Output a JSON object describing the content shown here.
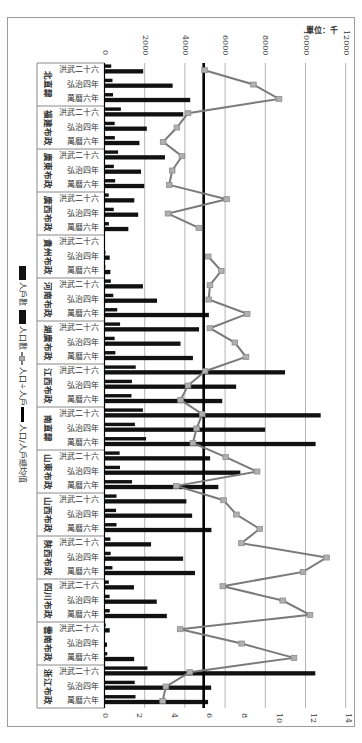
{
  "chart_data": {
    "type": "bar",
    "orientation": "rotated 90° clockwise (horizontal bars, categories top-to-bottom)",
    "unit_label": "單位：千",
    "primary_axis": {
      "ticks": [
        0,
        2000,
        4000,
        6000,
        8000,
        10000,
        12000
      ],
      "range": [
        0,
        12000
      ],
      "label": ""
    },
    "secondary_axis": {
      "ticks": [
        0,
        2,
        4,
        6,
        8,
        10,
        12,
        14
      ],
      "range": [
        0,
        14
      ],
      "label": ""
    },
    "grid": true,
    "legend_position": "left (rotated)",
    "legend": [
      {
        "label": "人戶數",
        "kind": "bar"
      },
      {
        "label": "人口數",
        "kind": "bar"
      },
      {
        "label": "人口÷人戶",
        "kind": "line-marker"
      },
      {
        "label": "人口/人戶總均值",
        "kind": "line"
      }
    ],
    "periods": [
      "洪武二十六",
      "弘治四年",
      "萬曆六年"
    ],
    "mean_ratio": 5.7,
    "colors": {
      "bars": "#111111",
      "ratio_line": "#7a7a7a",
      "ratio_marker": "#b0b0b0",
      "mean_line": "#000000",
      "grid": "#b5b5b5"
    },
    "groups": [
      {
        "province": "北直隸",
        "rows": [
          {
            "period": "洪武二十六",
            "households": 334.8,
            "population": 1926.6,
            "ratio": 5.75
          },
          {
            "period": "弘治四年",
            "households": 396.0,
            "population": 3390.0,
            "ratio": 8.56
          },
          {
            "period": "萬曆六年",
            "households": 425.5,
            "population": 4265.7,
            "ratio": 10.03
          }
        ]
      },
      {
        "province": "福建布政",
        "rows": [
          {
            "period": "洪武二十六",
            "households": 815.5,
            "population": 3916.8,
            "ratio": 4.8
          },
          {
            "period": "弘治四年",
            "households": 506.0,
            "population": 2106.1,
            "ratio": 4.16
          },
          {
            "period": "萬曆六年",
            "households": 515.3,
            "population": 1738.8,
            "ratio": 3.37
          }
        ]
      },
      {
        "province": "廣東布政",
        "rows": [
          {
            "period": "洪武二十六",
            "households": 675.6,
            "population": 3007.9,
            "ratio": 4.45
          },
          {
            "period": "弘治四年",
            "households": 467.4,
            "population": 1817.4,
            "ratio": 3.89
          },
          {
            "period": "萬曆六年",
            "households": 530.7,
            "population": 1976.0,
            "ratio": 3.72
          }
        ]
      },
      {
        "province": "廣西布政",
        "rows": [
          {
            "period": "洪武二十六",
            "households": 211.3,
            "population": 1482.7,
            "ratio": 7.02
          },
          {
            "period": "弘治四年",
            "households": 459.6,
            "population": 1676.3,
            "ratio": 3.65
          },
          {
            "period": "萬曆六年",
            "households": 218.7,
            "population": 1186.2,
            "ratio": 5.42
          }
        ]
      },
      {
        "province": "貴州布政",
        "rows": [
          {
            "period": "洪武二十六",
            "households": null,
            "population": null,
            "ratio": null
          },
          {
            "period": "弘治四年",
            "households": 43.4,
            "population": 258.7,
            "ratio": 5.96
          },
          {
            "period": "萬曆六年",
            "households": 43.4,
            "population": 291.0,
            "ratio": 6.71
          }
        ]
      },
      {
        "province": "河南布政",
        "rows": [
          {
            "period": "洪武二十六",
            "households": 315.6,
            "population": 1912.5,
            "ratio": 6.06
          },
          {
            "period": "弘治四年",
            "households": 436.8,
            "population": 2614.4,
            "ratio": 5.99
          },
          {
            "period": "萬曆六年",
            "households": 633.1,
            "population": 5193.6,
            "ratio": 8.2
          }
        ]
      },
      {
        "province": "湖廣布政",
        "rows": [
          {
            "period": "洪武二十六",
            "households": 775.9,
            "population": 4702.7,
            "ratio": 6.06
          },
          {
            "period": "弘治四年",
            "households": 504.9,
            "population": 3781.7,
            "ratio": 7.49
          },
          {
            "period": "萬曆六年",
            "households": 541.3,
            "population": 4398.8,
            "ratio": 8.13
          }
        ]
      },
      {
        "province": "江西布政",
        "rows": [
          {
            "period": "洪武二十六",
            "households": 1553.9,
            "population": 8982.5,
            "ratio": 5.78
          },
          {
            "period": "弘治四年",
            "households": 1363.6,
            "population": 6549.8,
            "ratio": 4.8
          },
          {
            "period": "萬曆六年",
            "households": 1341.0,
            "population": 5859.0,
            "ratio": 4.37
          }
        ]
      },
      {
        "province": "南直隸",
        "rows": [
          {
            "period": "洪武二十六",
            "households": 1912.8,
            "population": 10755.9,
            "ratio": 5.62
          },
          {
            "period": "弘治四年",
            "households": 1511.2,
            "population": 7993.4,
            "ratio": 5.29
          },
          {
            "period": "萬曆六年",
            "households": 2069.1,
            "population": 10502.7,
            "ratio": 5.08
          }
        ]
      },
      {
        "province": "山東布政",
        "rows": [
          {
            "period": "洪武二十六",
            "households": 753.9,
            "population": 5255.9,
            "ratio": 6.97
          },
          {
            "period": "弘治四年",
            "households": 770.6,
            "population": 6759.7,
            "ratio": 8.77
          },
          {
            "period": "萬曆六年",
            "households": 1372.2,
            "population": 5664.1,
            "ratio": 4.13
          }
        ]
      },
      {
        "province": "山西布政",
        "rows": [
          {
            "period": "洪武二十六",
            "households": 595.4,
            "population": 4072.1,
            "ratio": 6.84
          },
          {
            "period": "弘治四年",
            "households": 575.2,
            "population": 4360.5,
            "ratio": 7.58
          },
          {
            "period": "萬曆六年",
            "households": 596.1,
            "population": 5319.4,
            "ratio": 8.92
          }
        ]
      },
      {
        "province": "陝西布政",
        "rows": [
          {
            "period": "洪武二十六",
            "households": 294.5,
            "population": 2316.6,
            "ratio": 7.87
          },
          {
            "period": "弘治四年",
            "households": 306.6,
            "population": 3912.4,
            "ratio": 12.76
          },
          {
            "period": "萬曆六年",
            "households": 394.4,
            "population": 4502.1,
            "ratio": 11.41
          }
        ]
      },
      {
        "province": "四川布政",
        "rows": [
          {
            "period": "洪武二十六",
            "households": 215.7,
            "population": 1466.8,
            "ratio": 6.8
          },
          {
            "period": "弘治四年",
            "households": 253.8,
            "population": 2598.5,
            "ratio": 10.24
          },
          {
            "period": "萬曆六年",
            "households": 262.7,
            "population": 3102.1,
            "ratio": 11.81
          }
        ]
      },
      {
        "province": "雲南布政",
        "rows": [
          {
            "period": "洪武二十六",
            "households": 59.6,
            "population": 259.3,
            "ratio": 4.35
          },
          {
            "period": "弘治四年",
            "households": 16.0,
            "population": 126.0,
            "ratio": 7.88
          },
          {
            "period": "萬曆六年",
            "households": 135.6,
            "population": 1476.7,
            "ratio": 10.89
          }
        ]
      },
      {
        "province": "浙江布政",
        "rows": [
          {
            "period": "洪武二十六",
            "households": 2138.2,
            "population": 10487.6,
            "ratio": 4.9
          },
          {
            "period": "弘治四年",
            "households": 1503.1,
            "population": 5305.8,
            "ratio": 3.53
          },
          {
            "period": "萬曆六年",
            "households": 1542.4,
            "population": 5153.0,
            "ratio": 3.34
          }
        ]
      }
    ]
  }
}
